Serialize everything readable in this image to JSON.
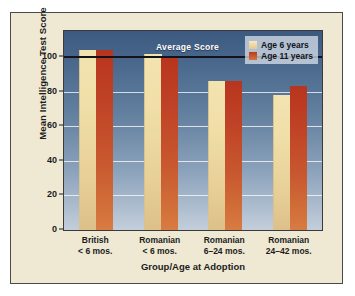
{
  "chart_data": {
    "type": "bar",
    "title": "",
    "xlabel": "Group/Age at Adoption",
    "ylabel": "Mean Intelligence Test Score",
    "ylim": [
      0,
      115
    ],
    "yticks": [
      0,
      20,
      40,
      60,
      80,
      100
    ],
    "grid": true,
    "legend_position": "top-right",
    "categories": [
      "British\n< 6 mos.",
      "Romanian\n< 6 mos.",
      "Romanian\n6–24 mos.",
      "Romanian\n24–42 mos."
    ],
    "category_lines": [
      [
        "British",
        "< 6 mos."
      ],
      [
        "Romanian",
        "< 6 mos."
      ],
      [
        "Romanian",
        "6–24 mos."
      ],
      [
        "Romanian",
        "24–42 mos."
      ]
    ],
    "series": [
      {
        "name": "Age 6 years",
        "color": "#eedb9f",
        "values": [
          104,
          102,
          86,
          78
        ]
      },
      {
        "name": "Age 11 years",
        "color": "#c2441f",
        "values": [
          104,
          100,
          86,
          83
        ]
      }
    ],
    "annotations": [
      {
        "name": "average-score",
        "label": "Average Score",
        "y": 100
      }
    ]
  },
  "axis": {
    "y_title": "Mean Intelligence Test Score",
    "x_title": "Group/Age at Adoption",
    "y_tick_labels": [
      "100",
      "80",
      "60",
      "40",
      "20",
      "0"
    ]
  },
  "legend": {
    "items": [
      {
        "label": "Age 6 years"
      },
      {
        "label": "Age 11 years"
      }
    ]
  },
  "annotation": {
    "average_score": "Average Score"
  },
  "colors": {
    "page_background": "#ffffff",
    "figure_background": "#efe9d4",
    "figure_border": "#4a4a46",
    "plot_top": "#3c5a80",
    "plot_bottom": "#c3cedb",
    "gridline": "#ffffff",
    "average_line": "#12131c",
    "series_age6": "#eedb9f",
    "series_age11": "#c2441f",
    "text": "#1c1c1c"
  }
}
